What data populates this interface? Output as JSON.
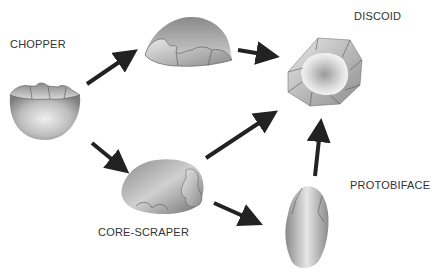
{
  "diagram": {
    "nodes": [
      {
        "id": "chopper",
        "label": "CHOPPER"
      },
      {
        "id": "intermediate",
        "label": ""
      },
      {
        "id": "discoid",
        "label": "DISCOID"
      },
      {
        "id": "core_scraper",
        "label": "CORE-SCRAPER"
      },
      {
        "id": "protobiface",
        "label": "PROTOBIFACE"
      }
    ],
    "edges": [
      {
        "from": "chopper",
        "to": "intermediate"
      },
      {
        "from": "chopper",
        "to": "core_scraper"
      },
      {
        "from": "intermediate",
        "to": "discoid"
      },
      {
        "from": "core_scraper",
        "to": "discoid"
      },
      {
        "from": "core_scraper",
        "to": "protobiface"
      },
      {
        "from": "protobiface",
        "to": "discoid"
      }
    ],
    "colors": {
      "arrow": "#222222",
      "stone_dark": "#7a7a7a",
      "stone_light": "#e8e8e8",
      "text": "#333333"
    }
  }
}
